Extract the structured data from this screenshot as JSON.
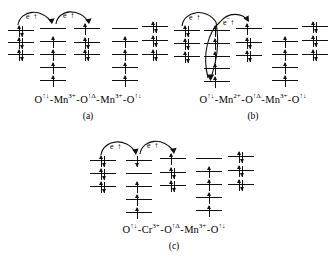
{
  "figure": {
    "panels": [
      {
        "id": "a",
        "label": "(a)",
        "formula_parts": [
          {
            "element": "O",
            "charge": "",
            "spin_sup": "↑↓"
          },
          {
            "element": "Mn",
            "charge": "3+",
            "spin_sup": ""
          },
          {
            "element": "O",
            "charge": "",
            "spin_sup": "↑Δ"
          },
          {
            "element": "Mn",
            "charge": "3+",
            "spin_sup": ""
          },
          {
            "element": "O",
            "charge": "",
            "spin_sup": "↑↓"
          }
        ],
        "formula_text": "O↑↓ - Mn3+ - O↑Δ - Mn3+ - O↑↓",
        "electron_labels": [
          "e",
          "e"
        ],
        "electron_sup": "−",
        "columns": [
          {
            "name": "oxygen-left",
            "levels": [
              {
                "spins": [
                  "up",
                  "down"
                ]
              },
              {
                "spins": [
                  "up",
                  "down"
                ]
              },
              {
                "spins": [
                  "up",
                  "down"
                ]
              }
            ]
          },
          {
            "name": "manganese-left",
            "levels": [
              {
                "spins": []
              },
              {
                "spins": [
                  "up"
                ]
              },
              {
                "spins": [
                  "up"
                ]
              },
              {
                "spins": [
                  "up"
                ]
              },
              {
                "spins": [
                  "up"
                ]
              }
            ]
          },
          {
            "name": "oxygen-middle",
            "levels": [
              {
                "spins": [
                  "up"
                ]
              },
              {
                "spins": [
                  "up",
                  "down"
                ]
              },
              {
                "spins": [
                  "up",
                  "down"
                ]
              }
            ]
          },
          {
            "name": "manganese-right",
            "levels": [
              {
                "spins": []
              },
              {
                "spins": [
                  "up"
                ]
              },
              {
                "spins": [
                  "up"
                ]
              },
              {
                "spins": [
                  "up"
                ]
              },
              {
                "spins": [
                  "up"
                ]
              }
            ]
          },
          {
            "name": "oxygen-right",
            "levels": [
              {
                "spins": [
                  "up",
                  "down"
                ]
              },
              {
                "spins": [
                  "up",
                  "down"
                ]
              },
              {
                "spins": [
                  "up",
                  "down"
                ]
              }
            ]
          }
        ]
      },
      {
        "id": "b",
        "label": "(b)",
        "formula_parts": [
          {
            "element": "O",
            "charge": "",
            "spin_sup": "↑↓"
          },
          {
            "element": "Mn",
            "charge": "2+",
            "spin_sup": ""
          },
          {
            "element": "O",
            "charge": "",
            "spin_sup": "↑Δ"
          },
          {
            "element": "Mn",
            "charge": "3+",
            "spin_sup": ""
          },
          {
            "element": "O",
            "charge": "",
            "spin_sup": "↑↓"
          }
        ],
        "formula_text": "O↑↓ - Mn2+ - O↑Δ - Mn3+ - O↑↓",
        "electron_labels": [
          "e",
          "e"
        ],
        "electron_sup": "−",
        "columns": [
          {
            "name": "oxygen-left",
            "levels": [
              {
                "spins": [
                  "up",
                  "down"
                ]
              },
              {
                "spins": [
                  "up",
                  "down"
                ]
              },
              {
                "spins": [
                  "up",
                  "down"
                ]
              }
            ]
          },
          {
            "name": "manganese-left",
            "levels": [
              {
                "spins": [
                  "up"
                ]
              },
              {
                "spins": [
                  "up"
                ]
              },
              {
                "spins": [
                  "up"
                ]
              },
              {
                "spins": [
                  "up"
                ]
              },
              {
                "spins": [
                  "up"
                ]
              }
            ]
          },
          {
            "name": "oxygen-middle",
            "levels": [
              {
                "spins": [
                  "up"
                ]
              },
              {
                "spins": [
                  "up",
                  "down"
                ]
              },
              {
                "spins": [
                  "up",
                  "down"
                ]
              }
            ]
          },
          {
            "name": "manganese-right",
            "levels": [
              {
                "spins": []
              },
              {
                "spins": [
                  "up"
                ]
              },
              {
                "spins": [
                  "up"
                ]
              },
              {
                "spins": [
                  "up"
                ]
              },
              {
                "spins": [
                  "up"
                ]
              }
            ]
          },
          {
            "name": "oxygen-right",
            "levels": [
              {
                "spins": [
                  "up",
                  "down"
                ]
              },
              {
                "spins": [
                  "up",
                  "down"
                ]
              },
              {
                "spins": [
                  "up",
                  "down"
                ]
              }
            ]
          }
        ]
      },
      {
        "id": "c",
        "label": "(c)",
        "formula_parts": [
          {
            "element": "O",
            "charge": "",
            "spin_sup": "↑↓"
          },
          {
            "element": "Cr",
            "charge": "3+",
            "spin_sup": ""
          },
          {
            "element": "O",
            "charge": "",
            "spin_sup": "↑Δ"
          },
          {
            "element": "Mn",
            "charge": "3+",
            "spin_sup": ""
          },
          {
            "element": "O",
            "charge": "",
            "spin_sup": "↑↓"
          }
        ],
        "formula_text": "O↑↓ - Cr3+ - O↑Δ - Mn3+ - O↑↓",
        "electron_labels": [
          "e",
          "e"
        ],
        "electron_sup": "−",
        "columns": [
          {
            "name": "oxygen-left",
            "levels": [
              {
                "spins": [
                  "up",
                  "down"
                ]
              },
              {
                "spins": [
                  "up",
                  "down"
                ]
              },
              {
                "spins": [
                  "up",
                  "down"
                ]
              }
            ]
          },
          {
            "name": "chromium",
            "levels": [
              {
                "spins": [
                  "down"
                ]
              },
              {
                "spins": []
              },
              {
                "spins": [
                  "up"
                ]
              },
              {
                "spins": [
                  "up"
                ]
              },
              {
                "spins": [
                  "up"
                ]
              }
            ]
          },
          {
            "name": "oxygen-middle",
            "levels": [
              {
                "spins": [
                  "up"
                ]
              },
              {
                "spins": [
                  "up",
                  "down"
                ]
              },
              {
                "spins": [
                  "up",
                  "down"
                ]
              }
            ]
          },
          {
            "name": "manganese-right",
            "levels": [
              {
                "spins": []
              },
              {
                "spins": [
                  "up"
                ]
              },
              {
                "spins": [
                  "up"
                ]
              },
              {
                "spins": [
                  "up"
                ]
              },
              {
                "spins": [
                  "up"
                ]
              }
            ]
          },
          {
            "name": "oxygen-right",
            "levels": [
              {
                "spins": [
                  "up",
                  "down"
                ]
              },
              {
                "spins": [
                  "up",
                  "down"
                ]
              },
              {
                "spins": [
                  "up",
                  "down"
                ]
              }
            ]
          }
        ]
      }
    ]
  },
  "colors": {
    "ink": "#111111",
    "background": "#ffffff"
  }
}
